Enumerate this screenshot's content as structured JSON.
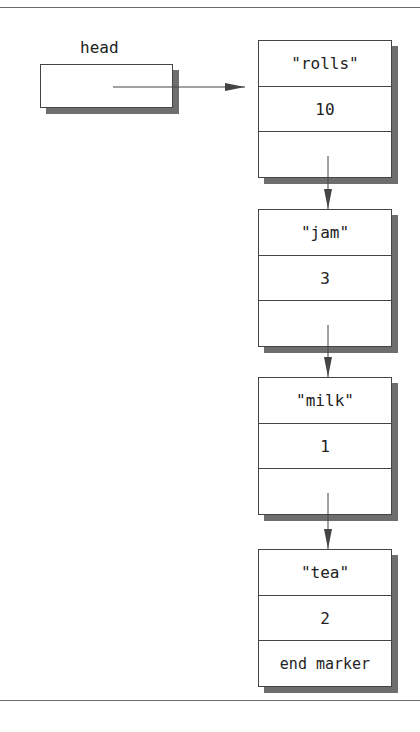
{
  "diagram": {
    "type": "linked-list",
    "head_label": "head",
    "nodes": [
      {
        "name": "\"rolls\"",
        "quantity": "10",
        "next": ""
      },
      {
        "name": "\"jam\"",
        "quantity": "3",
        "next": ""
      },
      {
        "name": "\"milk\"",
        "quantity": "1",
        "next": ""
      },
      {
        "name": "\"tea\"",
        "quantity": "2",
        "next": "end marker"
      }
    ],
    "colors": {
      "border": "#444444",
      "shadow": "#6e6e6e",
      "rule": "#6a6a6a",
      "arrow": "#444444"
    }
  }
}
